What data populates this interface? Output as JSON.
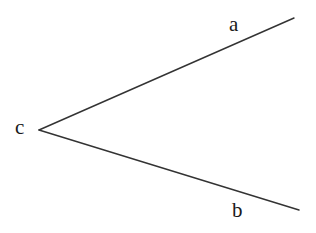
{
  "diagram": {
    "type": "angle",
    "vertex": {
      "label": "c",
      "x": 39,
      "y": 130
    },
    "rays": [
      {
        "label": "a",
        "end": {
          "x": 294,
          "y": 18
        }
      },
      {
        "label": "b",
        "end": {
          "x": 299,
          "y": 210
        }
      }
    ],
    "labels": {
      "a": "a",
      "b": "b",
      "c": "c"
    },
    "line_color": "#333333",
    "background": "#ffffff"
  }
}
